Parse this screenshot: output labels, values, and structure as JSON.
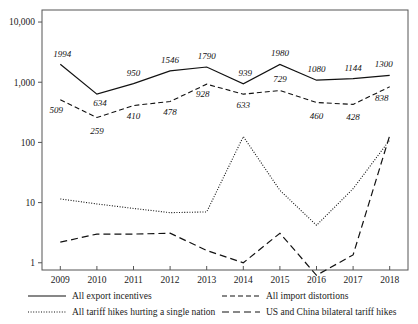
{
  "chart_data": {
    "type": "line",
    "title": "",
    "xlabel": "",
    "ylabel": "",
    "yscale": "log",
    "ylim": [
      1,
      10000
    ],
    "grid": false,
    "legend_position": "bottom",
    "categories": [
      "2009",
      "2010",
      "2011",
      "2012",
      "2013",
      "2014",
      "2015",
      "2016",
      "2017",
      "2018"
    ],
    "ytick_labels": [
      "10,000",
      "1,000",
      "100",
      "10",
      "1"
    ],
    "ytick_values": [
      10000,
      1000,
      100,
      10,
      1
    ],
    "series": [
      {
        "name": "All export incentives",
        "style": "solid",
        "labeled": true,
        "values": [
          1994,
          634,
          950,
          1546,
          1790,
          939,
          1980,
          1080,
          1144,
          1300
        ],
        "labels": [
          "1994",
          "634",
          "950",
          "1546",
          "1790",
          "939",
          "1980",
          "1080",
          "1144",
          "1300"
        ]
      },
      {
        "name": "All import distortions",
        "style": "short-dash",
        "labeled": true,
        "values": [
          509,
          259,
          410,
          478,
          928,
          633,
          729,
          460,
          428,
          838
        ],
        "labels": [
          "509",
          "259",
          "410",
          "478",
          "928",
          "633",
          "729",
          "460",
          "428",
          "838"
        ]
      },
      {
        "name": "All tariff hikes hurting a single nation",
        "style": "dotted",
        "labeled": false,
        "values": [
          11.5,
          9.5,
          8.0,
          6.8,
          7.0,
          125,
          16,
          4.2,
          17,
          110
        ]
      },
      {
        "name": "US and China bilateral tariff hikes",
        "style": "long-dash",
        "labeled": false,
        "values": [
          2.2,
          3.0,
          3.0,
          3.1,
          1.6,
          1.0,
          3.1,
          0.62,
          1.35,
          130
        ]
      }
    ],
    "legend": [
      {
        "label": "All export incentives",
        "style": "solid"
      },
      {
        "label": "All import distortions",
        "style": "short-dash"
      },
      {
        "label": "All tariff hikes hurting a single nation",
        "style": "dotted"
      },
      {
        "label": "US and China bilateral tariff hikes",
        "style": "long-dash"
      }
    ]
  },
  "label_offsets": {
    "series0": [
      {
        "dx": 2,
        "dy": -7
      },
      {
        "dx": 3,
        "dy": 12
      },
      {
        "dx": 0,
        "dy": -8
      },
      {
        "dx": 0,
        "dy": -8
      },
      {
        "dx": 0,
        "dy": -8
      },
      {
        "dx": 2,
        "dy": -8
      },
      {
        "dx": 0,
        "dy": -8
      },
      {
        "dx": 0,
        "dy": -8
      },
      {
        "dx": 0,
        "dy": -8
      },
      {
        "dx": -6,
        "dy": -8
      }
    ],
    "series1": [
      {
        "dx": -4,
        "dy": 13
      },
      {
        "dx": 0,
        "dy": 16
      },
      {
        "dx": 0,
        "dy": 13
      },
      {
        "dx": 0,
        "dy": 13
      },
      {
        "dx": -4,
        "dy": 13
      },
      {
        "dx": 0,
        "dy": 14
      },
      {
        "dx": 0,
        "dy": -8
      },
      {
        "dx": 0,
        "dy": 16
      },
      {
        "dx": 0,
        "dy": 16
      },
      {
        "dx": -8,
        "dy": 14
      }
    ]
  }
}
